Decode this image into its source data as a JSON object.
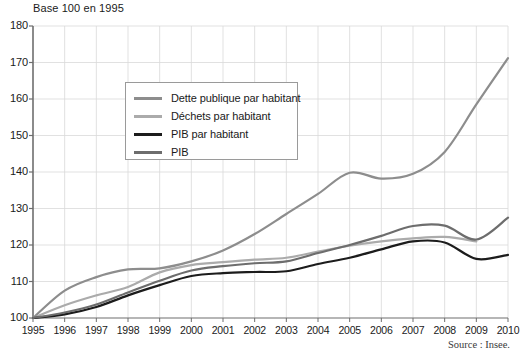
{
  "chart": {
    "title": "Base 100 en 1995",
    "source": "Source : Insee.",
    "colors": {
      "dette": "#8d8d8d",
      "dechets": "#ababab",
      "pib_hab": "#1c1c1c",
      "pib": "#6d6d6d",
      "axis": "#6e6e6e",
      "grid": "#d9d9d9"
    }
  },
  "chart_data": {
    "type": "line",
    "title": "Base 100 en 1995",
    "subtitle": "",
    "xlabel": "",
    "ylabel": "",
    "xlim": [
      1995,
      2010
    ],
    "ylim": [
      100,
      180
    ],
    "grid": true,
    "legend_position": "upper-left-inside",
    "annotations": [
      "Source : Insee."
    ],
    "x": [
      1995,
      1996,
      1997,
      1998,
      1999,
      2000,
      2001,
      2002,
      2003,
      2004,
      2005,
      2006,
      2007,
      2008,
      2009,
      2010
    ],
    "xtick_labels": [
      "1995",
      "1996",
      "1997",
      "1998",
      "1999",
      "2000",
      "2001",
      "2002",
      "2003",
      "2004",
      "2005",
      "2006",
      "2007",
      "2008",
      "2009",
      "2010"
    ],
    "ytick_labels": [
      "100",
      "110",
      "120",
      "130",
      "140",
      "150",
      "160",
      "170",
      "180"
    ],
    "yticks": [
      100,
      110,
      120,
      130,
      140,
      150,
      160,
      170,
      180
    ],
    "series": [
      {
        "name": "Dette publique par habitant",
        "color": "#8d8d8d",
        "width": 2.2,
        "values": [
          100.0,
          107.5,
          111.2,
          113.3,
          113.6,
          115.5,
          118.5,
          123.0,
          128.5,
          134.0,
          139.8,
          138.2,
          139.5,
          145.5,
          158.5,
          171.2
        ]
      },
      {
        "name": "Déchets par habitant",
        "color": "#ababab",
        "width": 2.2,
        "values": [
          100.0,
          103.5,
          106.2,
          108.5,
          112.5,
          114.5,
          115.3,
          116.0,
          116.5,
          118.2,
          119.8,
          121.0,
          121.8,
          122.2,
          121.0,
          null
        ]
      },
      {
        "name": "PIB par habitant",
        "color": "#1c1c1c",
        "width": 2.2,
        "values": [
          100.0,
          101.0,
          103.0,
          106.2,
          109.0,
          111.5,
          112.3,
          112.6,
          112.8,
          114.8,
          116.5,
          118.8,
          121.0,
          120.7,
          116.2,
          117.3
        ]
      },
      {
        "name": "PIB",
        "color": "#6d6d6d",
        "width": 2.2,
        "values": [
          100.0,
          101.5,
          103.7,
          107.0,
          110.2,
          113.0,
          114.2,
          115.0,
          115.5,
          117.8,
          120.0,
          122.5,
          125.2,
          125.3,
          121.5,
          127.5
        ]
      }
    ]
  },
  "legend": {
    "items": [
      {
        "label": "Dette publique par habitant",
        "color": "#8d8d8d",
        "thickness": 3
      },
      {
        "label": "Déchets par habitant",
        "color": "#ababab",
        "thickness": 3
      },
      {
        "label": "PIB par habitant",
        "color": "#1c1c1c",
        "thickness": 3
      },
      {
        "label": "PIB",
        "color": "#6d6d6d",
        "thickness": 3
      }
    ]
  }
}
